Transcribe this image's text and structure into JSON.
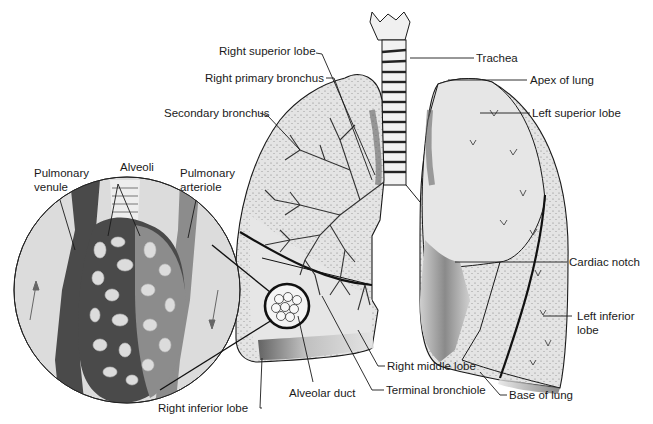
{
  "diagram": {
    "colors": {
      "background": "#ffffff",
      "lung_fill": "#e4e4e4",
      "lung_shade": "#9a9a9a",
      "outline": "#1a1a1a",
      "venule": "#4a4a4a",
      "arteriole": "#8c8c8c",
      "inset_bg": "#dcdcdc"
    },
    "labels": {
      "trachea": "Trachea",
      "apex_of_lung": "Apex of lung",
      "left_superior_lobe": "Left superior lobe",
      "cardiac_notch": "Cardiac notch",
      "left_inferior_lobe_line1": "Left inferior",
      "left_inferior_lobe_line2": "lobe",
      "base_of_lung": "Base of lung",
      "right_superior_lobe": "Right superior lobe",
      "right_primary_bronchus": "Right primary bronchus",
      "secondary_bronchus": "Secondary bronchus",
      "right_middle_lobe": "Right middle lobe",
      "terminal_bronchiole": "Terminal bronchiole",
      "alveolar_duct": "Alveolar duct",
      "right_inferior_lobe": "Right inferior lobe",
      "pulmonary_venule_line1": "Pulmonary",
      "pulmonary_venule_line2": "venule",
      "alveoli": "Alveoli",
      "pulmonary_arteriole_line1": "Pulmonary",
      "pulmonary_arteriole_line2": "arteriole"
    }
  }
}
